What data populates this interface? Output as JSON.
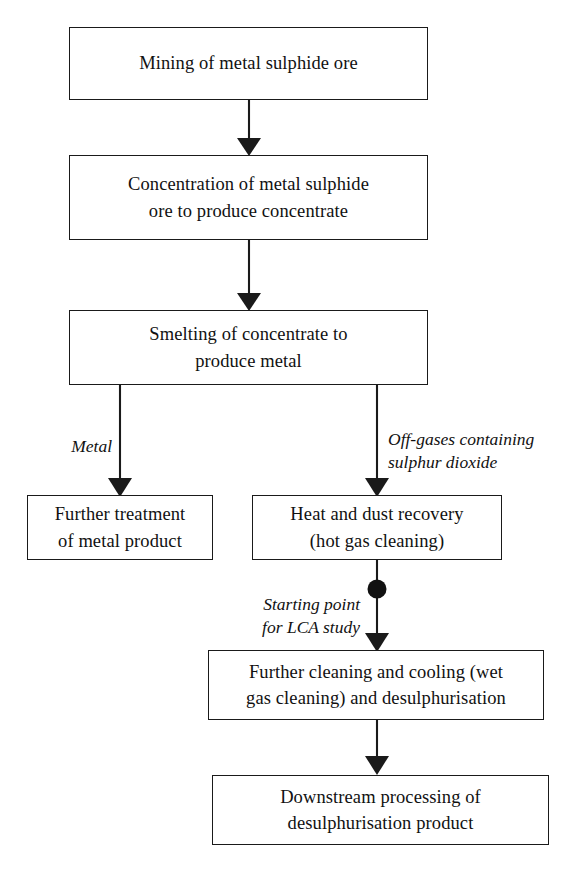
{
  "diagram": {
    "type": "flowchart",
    "orientation": "top-to-bottom",
    "colors": {
      "background": "#ffffff",
      "stroke": "#1a1a1a",
      "text": "#111111"
    },
    "nodes": [
      {
        "id": "mining",
        "label": "Mining of metal sulphide ore",
        "lines": [
          "Mining of metal sulphide ore"
        ]
      },
      {
        "id": "concentration",
        "label": "Concentration of metal sulphide ore to produce concentrate",
        "lines": [
          "Concentration of metal sulphide",
          "ore to produce concentrate"
        ]
      },
      {
        "id": "smelting",
        "label": "Smelting of concentrate to produce metal",
        "lines": [
          "Smelting of concentrate to",
          "produce metal"
        ]
      },
      {
        "id": "further-treatment",
        "label": "Further treatment of metal product",
        "lines": [
          "Further treatment",
          "of metal product"
        ]
      },
      {
        "id": "heat-dust-recovery",
        "label": "Heat and dust recovery (hot gas cleaning)",
        "lines": [
          "Heat and dust recovery",
          "(hot gas cleaning)"
        ]
      },
      {
        "id": "wet-gas-cleaning",
        "label": "Further cleaning and cooling (wet gas cleaning) and desulphurisation",
        "lines": [
          "Further cleaning and cooling (wet",
          "gas cleaning) and desulphurisation"
        ]
      },
      {
        "id": "downstream",
        "label": "Downstream processing of desulphurisation product",
        "lines": [
          "Downstream processing of",
          "desulphurisation product"
        ]
      }
    ],
    "edge_labels": [
      {
        "id": "metal",
        "text": "Metal",
        "style": "italic",
        "position": "left-of-line"
      },
      {
        "id": "off-gases",
        "text": "Off-gases containing\nsulphur dioxide",
        "style": "italic",
        "position": "right-of-line"
      },
      {
        "id": "starting-point",
        "text": "Starting point\nfor LCA study",
        "style": "italic",
        "position": "left-of-line"
      }
    ],
    "markers": [
      {
        "id": "lca-start-dot",
        "shape": "filled-circle",
        "describes": "starting-point"
      }
    ]
  }
}
